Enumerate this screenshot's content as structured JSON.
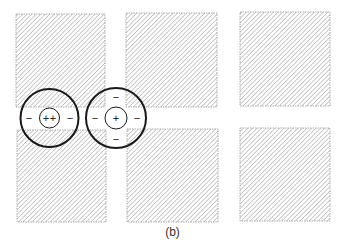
{
  "figure": {
    "caption": "(b)",
    "hatch_color": "#8a8a8a",
    "border_color": "#9a9a9a",
    "circle_color": "#1a1a1a",
    "squares": [
      {
        "x": 16,
        "y": 14,
        "w": 89,
        "h": 93
      },
      {
        "x": 126,
        "y": 13,
        "w": 91,
        "h": 94
      },
      {
        "x": 240,
        "y": 12,
        "w": 90,
        "h": 94
      },
      {
        "x": 17,
        "y": 130,
        "w": 89,
        "h": 92
      },
      {
        "x": 127,
        "y": 129,
        "w": 91,
        "h": 93
      },
      {
        "x": 240,
        "y": 128,
        "w": 90,
        "h": 93
      }
    ],
    "receptive_fields": [
      {
        "name": "intersection-field",
        "cx": 49.5,
        "cy": 118,
        "outer_r": 29,
        "inner_r": 10,
        "center_signs": [
          "+",
          "+"
        ],
        "surround_signs": [
          {
            "sign": "−",
            "x": 29,
            "y": 118
          },
          {
            "sign": "−",
            "x": 70,
            "y": 118
          }
        ]
      },
      {
        "name": "street-field",
        "cx": 116,
        "cy": 118,
        "outer_r": 30,
        "inner_r": 11,
        "center_signs": [
          "+"
        ],
        "surround_signs": [
          {
            "sign": "−",
            "x": 116,
            "y": 97
          },
          {
            "sign": "−",
            "x": 95,
            "y": 118
          },
          {
            "sign": "−",
            "x": 137,
            "y": 118
          },
          {
            "sign": "−",
            "x": 116,
            "y": 139
          }
        ]
      }
    ]
  }
}
